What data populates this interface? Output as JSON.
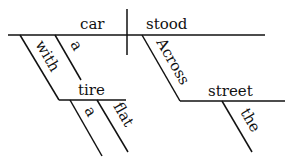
{
  "diagram": {
    "type": "sentence-diagram",
    "words": {
      "subject": "car",
      "verb": "stood",
      "subject_article": "a",
      "subject_preposition": "with",
      "prep_object": "tire",
      "object_article": "a",
      "object_adjective": "flat",
      "verb_preposition": "Across",
      "verb_prep_object": "street",
      "verb_prep_article": "the"
    }
  }
}
